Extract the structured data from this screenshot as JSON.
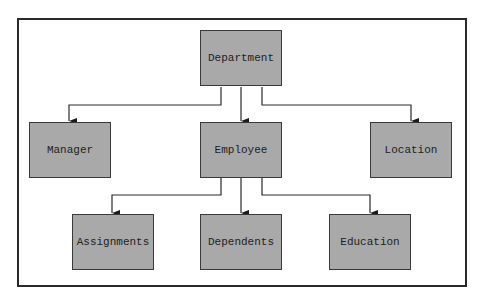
{
  "diagram": {
    "type": "hierarchy",
    "colors": {
      "node_fill": "#a9a9a9",
      "line": "#2a2a2a",
      "background": "#ffffff"
    },
    "root": "Department",
    "nodes": [
      {
        "id": "department",
        "label": "Department"
      },
      {
        "id": "manager",
        "label": "Manager"
      },
      {
        "id": "employee",
        "label": "Employee"
      },
      {
        "id": "location",
        "label": "Location"
      },
      {
        "id": "assignments",
        "label": "Assignments"
      },
      {
        "id": "dependents",
        "label": "Dependents"
      },
      {
        "id": "education",
        "label": "Education"
      }
    ],
    "edges": [
      {
        "from": "Department",
        "to": "Manager"
      },
      {
        "from": "Department",
        "to": "Employee"
      },
      {
        "from": "Department",
        "to": "Location"
      },
      {
        "from": "Employee",
        "to": "Assignments"
      },
      {
        "from": "Employee",
        "to": "Dependents"
      },
      {
        "from": "Employee",
        "to": "Education"
      }
    ]
  }
}
